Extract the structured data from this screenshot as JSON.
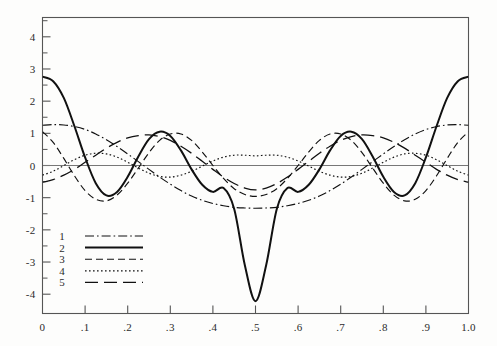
{
  "chart_data": {
    "type": "line",
    "title": "",
    "subtitle": "",
    "xlabel": "",
    "ylabel": "",
    "xlim": [
      0.0,
      1.0
    ],
    "ylim": [
      -4.6,
      4.6
    ],
    "grid": false,
    "legend_position": "lower-left-inside",
    "x_ticks": [
      "0",
      ".1",
      ".2",
      ".3",
      ".4",
      ".5",
      ".6",
      ".7",
      ".8",
      ".9",
      "1.0"
    ],
    "x_tick_values": [
      0.0,
      0.1,
      0.2,
      0.3,
      0.4,
      0.5,
      0.6,
      0.7,
      0.8,
      0.9,
      1.0
    ],
    "y_ticks": [
      "4",
      "3",
      "2",
      "1",
      "0",
      "-1",
      "-2",
      "-3",
      "-4"
    ],
    "y_tick_values": [
      4,
      3,
      2,
      1,
      0,
      -1,
      -2,
      -3,
      -4
    ],
    "y_minor_ticks": [
      4.5,
      3.5,
      2.5,
      1.5,
      0.5,
      -0.5,
      -1.5,
      -2.5,
      -3.5
    ],
    "legend": [
      {
        "label": "1",
        "style": "dash-dot"
      },
      {
        "label": "2",
        "style": "solid"
      },
      {
        "label": "3",
        "style": "dashed"
      },
      {
        "label": "4",
        "style": "dotted"
      },
      {
        "label": "5",
        "style": "long-dash"
      }
    ],
    "series": [
      {
        "name": "1",
        "style": "dash-dot",
        "x": [
          0.0,
          0.025,
          0.05,
          0.075,
          0.1,
          0.125,
          0.15,
          0.175,
          0.2,
          0.225,
          0.25,
          0.275,
          0.3,
          0.325,
          0.35,
          0.375,
          0.4,
          0.425,
          0.45,
          0.475,
          0.5,
          0.525,
          0.55,
          0.575,
          0.6,
          0.625,
          0.65,
          0.675,
          0.7,
          0.725,
          0.75,
          0.775,
          0.8,
          0.825,
          0.85,
          0.875,
          0.9,
          0.925,
          0.95,
          0.975,
          1.0
        ],
        "values": [
          1.25,
          1.27,
          1.26,
          1.21,
          1.12,
          0.98,
          0.8,
          0.59,
          0.36,
          0.12,
          -0.12,
          -0.36,
          -0.58,
          -0.78,
          -0.95,
          -1.08,
          -1.18,
          -1.25,
          -1.3,
          -1.32,
          -1.33,
          -1.32,
          -1.3,
          -1.25,
          -1.18,
          -1.08,
          -0.95,
          -0.78,
          -0.58,
          -0.36,
          -0.12,
          0.12,
          0.36,
          0.59,
          0.8,
          0.98,
          1.12,
          1.21,
          1.26,
          1.27,
          1.25
        ]
      },
      {
        "name": "2",
        "style": "solid",
        "x": [
          0.0,
          0.025,
          0.05,
          0.075,
          0.1,
          0.125,
          0.15,
          0.175,
          0.2,
          0.225,
          0.25,
          0.275,
          0.3,
          0.325,
          0.35,
          0.375,
          0.4,
          0.425,
          0.45,
          0.475,
          0.5,
          0.525,
          0.55,
          0.575,
          0.6,
          0.625,
          0.65,
          0.675,
          0.7,
          0.725,
          0.75,
          0.775,
          0.8,
          0.825,
          0.85,
          0.875,
          0.9,
          0.925,
          0.95,
          0.975,
          1.0
        ],
        "values": [
          2.76,
          2.62,
          2.1,
          1.22,
          0.25,
          -0.55,
          -0.93,
          -0.82,
          -0.35,
          0.28,
          0.82,
          1.05,
          0.92,
          0.47,
          -0.12,
          -0.6,
          -0.82,
          -0.7,
          -1.35,
          -3.1,
          -4.22,
          -3.1,
          -1.35,
          -0.7,
          -0.82,
          -0.6,
          -0.12,
          0.47,
          0.92,
          1.05,
          0.82,
          0.28,
          -0.35,
          -0.82,
          -0.93,
          -0.55,
          0.25,
          1.22,
          2.1,
          2.62,
          2.76
        ]
      },
      {
        "name": "3",
        "style": "dashed",
        "x": [
          0.0,
          0.025,
          0.05,
          0.075,
          0.1,
          0.125,
          0.15,
          0.175,
          0.2,
          0.225,
          0.25,
          0.275,
          0.3,
          0.325,
          0.35,
          0.375,
          0.4,
          0.425,
          0.45,
          0.475,
          0.5,
          0.525,
          0.55,
          0.575,
          0.6,
          0.625,
          0.65,
          0.675,
          0.7,
          0.725,
          0.75,
          0.775,
          0.8,
          0.825,
          0.85,
          0.875,
          0.9,
          0.925,
          0.95,
          0.975,
          1.0
        ],
        "values": [
          1.05,
          0.72,
          0.22,
          -0.32,
          -0.78,
          -1.05,
          -1.1,
          -0.92,
          -0.55,
          -0.08,
          0.4,
          0.78,
          0.98,
          0.98,
          0.78,
          0.42,
          0.0,
          -0.4,
          -0.72,
          -0.9,
          -0.96,
          -0.9,
          -0.72,
          -0.4,
          0.0,
          0.42,
          0.78,
          0.98,
          0.98,
          0.78,
          0.4,
          -0.08,
          -0.55,
          -0.92,
          -1.1,
          -1.05,
          -0.78,
          -0.32,
          0.22,
          0.72,
          1.05
        ]
      },
      {
        "name": "4",
        "style": "dotted",
        "x": [
          0.0,
          0.025,
          0.05,
          0.075,
          0.1,
          0.125,
          0.15,
          0.175,
          0.2,
          0.225,
          0.25,
          0.275,
          0.3,
          0.325,
          0.35,
          0.375,
          0.4,
          0.425,
          0.45,
          0.475,
          0.5,
          0.525,
          0.55,
          0.575,
          0.6,
          0.625,
          0.65,
          0.675,
          0.7,
          0.725,
          0.75,
          0.775,
          0.8,
          0.825,
          0.85,
          0.875,
          0.9,
          0.925,
          0.95,
          0.975,
          1.0
        ],
        "values": [
          -0.3,
          -0.18,
          0.0,
          0.18,
          0.32,
          0.38,
          0.36,
          0.26,
          0.1,
          -0.08,
          -0.24,
          -0.34,
          -0.36,
          -0.3,
          -0.18,
          -0.02,
          0.14,
          0.26,
          0.32,
          0.32,
          0.3,
          0.32,
          0.32,
          0.26,
          0.14,
          -0.02,
          -0.18,
          -0.3,
          -0.36,
          -0.34,
          -0.24,
          -0.08,
          0.1,
          0.26,
          0.36,
          0.38,
          0.32,
          0.18,
          0.0,
          -0.18,
          -0.3
        ]
      },
      {
        "name": "5",
        "style": "long-dash",
        "x": [
          0.0,
          0.025,
          0.05,
          0.075,
          0.1,
          0.125,
          0.15,
          0.175,
          0.2,
          0.225,
          0.25,
          0.275,
          0.3,
          0.325,
          0.35,
          0.375,
          0.4,
          0.425,
          0.45,
          0.475,
          0.5,
          0.525,
          0.55,
          0.575,
          0.6,
          0.625,
          0.65,
          0.675,
          0.7,
          0.725,
          0.75,
          0.775,
          0.8,
          0.825,
          0.85,
          0.875,
          0.9,
          0.925,
          0.95,
          0.975,
          1.0
        ],
        "values": [
          -0.52,
          -0.44,
          -0.3,
          -0.12,
          0.1,
          0.32,
          0.54,
          0.72,
          0.86,
          0.93,
          0.95,
          0.9,
          0.78,
          0.6,
          0.38,
          0.13,
          -0.12,
          -0.36,
          -0.56,
          -0.7,
          -0.76,
          -0.7,
          -0.56,
          -0.36,
          -0.12,
          0.13,
          0.38,
          0.6,
          0.78,
          0.9,
          0.95,
          0.93,
          0.86,
          0.72,
          0.54,
          0.32,
          0.1,
          -0.12,
          -0.3,
          -0.44,
          -0.52
        ]
      }
    ]
  },
  "figure": {
    "caption": ""
  }
}
